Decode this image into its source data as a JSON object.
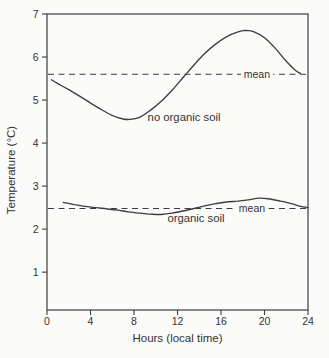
{
  "figure": {
    "background": "#fbfbf9",
    "ink": "#3d3d3d",
    "text_color": "#333333"
  },
  "chart_data": {
    "type": "line",
    "title": "",
    "xlabel": "Hours (local time)",
    "ylabel": "Temperature (°C)",
    "xlim": [
      0,
      24
    ],
    "ylim": [
      0.12,
      7
    ],
    "x_ticks": [
      0,
      4,
      8,
      12,
      16,
      20,
      24
    ],
    "y_ticks": [
      1,
      2,
      3,
      4,
      5,
      6,
      7
    ],
    "grid": false,
    "legend_position": "inline-labels",
    "x_units": "hours (local time)",
    "y_units": "degrees Celsius",
    "series": [
      {
        "name": "no organic soil",
        "line_style": "solid",
        "mean": 5.6,
        "mean_label": "mean",
        "mean_label_hour": 19.3,
        "label_anchor": {
          "hour": 12.6,
          "temp": 4.6
        },
        "points": [
          [
            0.4,
            5.47
          ],
          [
            1,
            5.38
          ],
          [
            2,
            5.24
          ],
          [
            3,
            5.09
          ],
          [
            4,
            4.93
          ],
          [
            5,
            4.78
          ],
          [
            6,
            4.64
          ],
          [
            7,
            4.56
          ],
          [
            7.6,
            4.55
          ],
          [
            8.5,
            4.6
          ],
          [
            9.5,
            4.76
          ],
          [
            10.5,
            4.97
          ],
          [
            11.5,
            5.23
          ],
          [
            12.5,
            5.52
          ],
          [
            13.5,
            5.81
          ],
          [
            14.5,
            6.08
          ],
          [
            15.5,
            6.3
          ],
          [
            16.5,
            6.47
          ],
          [
            17.5,
            6.58
          ],
          [
            18.2,
            6.62
          ],
          [
            19,
            6.59
          ],
          [
            20,
            6.45
          ],
          [
            21,
            6.2
          ],
          [
            22,
            5.9
          ],
          [
            22.8,
            5.7
          ],
          [
            23.3,
            5.62
          ]
        ]
      },
      {
        "name": "organic soil",
        "line_style": "solid",
        "mean": 2.48,
        "mean_label": "mean",
        "mean_label_hour": 18.85,
        "label_anchor": {
          "hour": 13.7,
          "temp": 2.26
        },
        "points": [
          [
            1.5,
            2.62
          ],
          [
            2.5,
            2.57
          ],
          [
            3.5,
            2.53
          ],
          [
            4.5,
            2.5
          ],
          [
            5.5,
            2.47
          ],
          [
            6.5,
            2.44
          ],
          [
            7.5,
            2.4
          ],
          [
            8.5,
            2.37
          ],
          [
            9.5,
            2.35
          ],
          [
            10.5,
            2.34
          ],
          [
            11.5,
            2.37
          ],
          [
            12.5,
            2.42
          ],
          [
            13.5,
            2.48
          ],
          [
            14.5,
            2.54
          ],
          [
            15.5,
            2.59
          ],
          [
            16.5,
            2.63
          ],
          [
            17.5,
            2.65
          ],
          [
            18.5,
            2.68
          ],
          [
            19.5,
            2.72
          ],
          [
            20.5,
            2.7
          ],
          [
            21.5,
            2.65
          ],
          [
            22.5,
            2.59
          ],
          [
            23.3,
            2.53
          ],
          [
            24,
            2.5
          ]
        ]
      }
    ]
  }
}
